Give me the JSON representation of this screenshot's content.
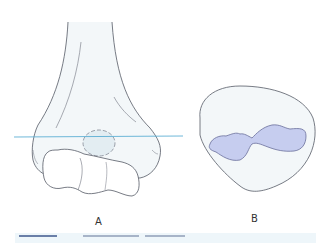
{
  "figure": {
    "panels": [
      {
        "id": "A",
        "label": "A",
        "description": "Anterior view of distal humerus with transverse section line"
      },
      {
        "id": "B",
        "label": "B",
        "description": "Cross-section through distal humerus showing medullary canal"
      }
    ],
    "colors": {
      "outline": "#555a66",
      "bone_fill": "#f3f7f9",
      "section_line": "#4aa6cf",
      "canal_fill": "#c6cdef",
      "canal_outline": "#6a6f9a",
      "strip_bg": "#eef6fa"
    }
  }
}
